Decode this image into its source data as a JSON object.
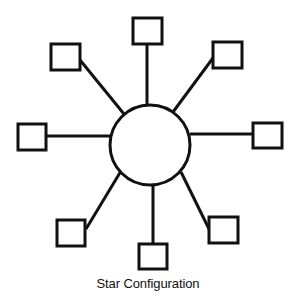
{
  "diagram": {
    "caption": "Star Configuration",
    "stroke_color": "#111111",
    "background": "#ffffff",
    "hub": {
      "name": "central-hub",
      "cx": 150,
      "cy": 145,
      "r": 40
    },
    "nodes": [
      {
        "name": "node-top",
        "x": 133,
        "y": 18,
        "w": 29,
        "h": 26,
        "line": [
          147,
          44,
          147,
          105
        ]
      },
      {
        "name": "node-top-left",
        "x": 51,
        "y": 44,
        "w": 29,
        "h": 26,
        "line": [
          80,
          60,
          124,
          114
        ]
      },
      {
        "name": "node-top-right",
        "x": 213,
        "y": 42,
        "w": 29,
        "h": 26,
        "line": [
          213,
          58,
          173,
          112
        ]
      },
      {
        "name": "node-left",
        "x": 18,
        "y": 124,
        "w": 28,
        "h": 26,
        "line": [
          46,
          136,
          110,
          136
        ]
      },
      {
        "name": "node-right",
        "x": 253,
        "y": 123,
        "w": 29,
        "h": 25,
        "line": [
          190,
          134,
          253,
          134
        ]
      },
      {
        "name": "node-bottom-left",
        "x": 57,
        "y": 220,
        "w": 28,
        "h": 26,
        "line": [
          121,
          171,
          86,
          229
        ]
      },
      {
        "name": "node-bottom",
        "x": 139,
        "y": 244,
        "w": 28,
        "h": 25,
        "line": [
          153,
          184,
          153,
          244
        ]
      },
      {
        "name": "node-bottom-right",
        "x": 209,
        "y": 217,
        "w": 29,
        "h": 26,
        "line": [
          181,
          172,
          209,
          229
        ]
      }
    ]
  }
}
